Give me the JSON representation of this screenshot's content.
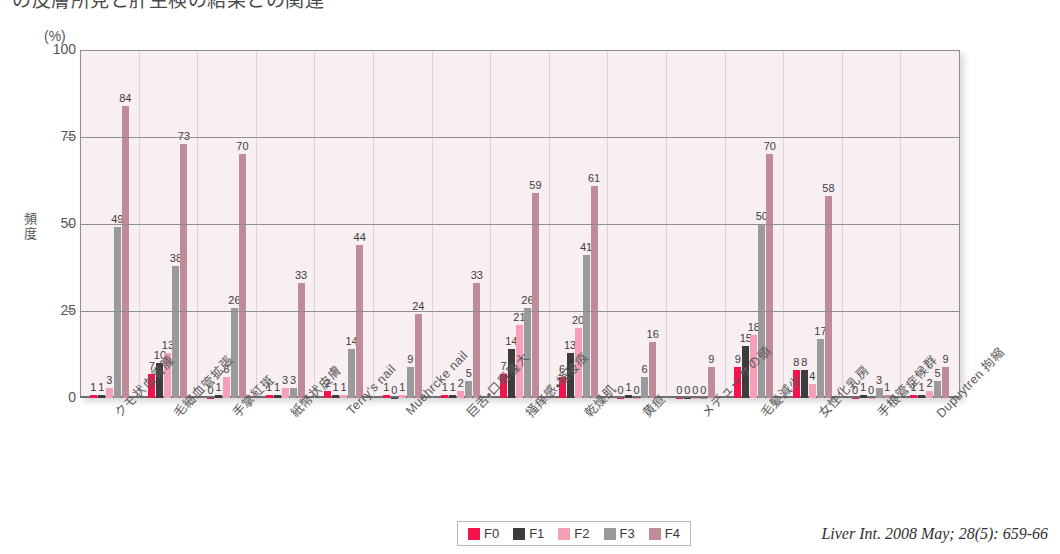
{
  "title": "の皮膚所見と肝生検の結果との関連",
  "axis": {
    "unit_label": "(%)",
    "y_title": "頻度",
    "y_ticks": [
      "100",
      "75",
      "50",
      "25",
      "0"
    ]
  },
  "legend": {
    "items": [
      {
        "label": "F0",
        "color": "#f4134a"
      },
      {
        "label": "F1",
        "color": "#3d3b3c"
      },
      {
        "label": "F2",
        "color": "#f4a0b6"
      },
      {
        "label": "F3",
        "color": "#9a9a9a"
      },
      {
        "label": "F4",
        "color": "#c08b99"
      }
    ]
  },
  "citation": "Liver Int. 2008 May; 28(5): 659-66",
  "chart_data": {
    "type": "bar",
    "title": "の皮膚所見と肝生検の結果との関連",
    "xlabel": "",
    "ylabel": "頻度",
    "unit": "%",
    "ylim": [
      0,
      100
    ],
    "yticks": [
      0,
      25,
      50,
      75,
      100
    ],
    "grid": true,
    "legend_position": "bottom-center",
    "categories": [
      "クモ状血管腫",
      "毛細血管拡張",
      "手掌紅斑",
      "紙幣状皮膚",
      "Terry's nail",
      "Muehrcke nail",
      "巨舌・口唇腫大",
      "掻痒感・掻破痕",
      "乾燥肌",
      "黄疸",
      "メデューサの頭",
      "毛髪減少",
      "女性化乳房",
      "手根管症候群",
      "Dupuytren 拘縮"
    ],
    "series": [
      {
        "name": "F0",
        "color": "#f4134a",
        "values": [
          1,
          7,
          0,
          1,
          2,
          1,
          1,
          7,
          6,
          0,
          0,
          9,
          8,
          0,
          1
        ]
      },
      {
        "name": "F1",
        "color": "#3d3b3c",
        "values": [
          1,
          10,
          1,
          1,
          1,
          0,
          1,
          14,
          13,
          1,
          0,
          15,
          8,
          1,
          1
        ]
      },
      {
        "name": "F2",
        "color": "#f4a0b6",
        "values": [
          3,
          13,
          6,
          3,
          1,
          1,
          2,
          21,
          20,
          0,
          0,
          18,
          4,
          0,
          2
        ]
      },
      {
        "name": "F3",
        "color": "#9a9a9a",
        "values": [
          49,
          38,
          26,
          3,
          14,
          9,
          5,
          26,
          41,
          6,
          0,
          50,
          17,
          3,
          5
        ]
      },
      {
        "name": "F4",
        "color": "#c08b99",
        "values": [
          84,
          73,
          70,
          33,
          44,
          24,
          33,
          59,
          61,
          16,
          9,
          70,
          58,
          1,
          9
        ]
      }
    ]
  }
}
